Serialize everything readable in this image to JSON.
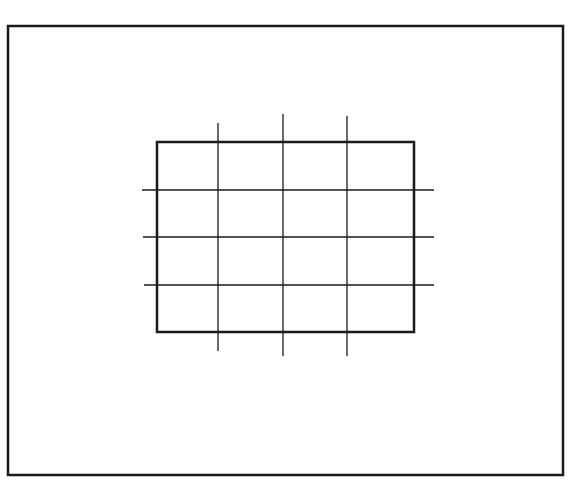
{
  "figure": {
    "stroke_color": "#1a1a1a",
    "background": "#ffffff",
    "outer_frame": {
      "x": 8,
      "y": 26,
      "w": 555,
      "h": 449,
      "stroke_width": 2.5
    },
    "inner_rect": {
      "x": 157,
      "y": 142,
      "w": 257,
      "h": 190,
      "stroke_width": 2.5
    },
    "vertical_lines": [
      {
        "x": 218,
        "y1": 123,
        "y2": 351
      },
      {
        "x": 283,
        "y1": 114,
        "y2": 356
      },
      {
        "x": 347,
        "y1": 116,
        "y2": 356
      }
    ],
    "horizontal_lines": [
      {
        "y": 190,
        "x1": 142,
        "x2": 434
      },
      {
        "y": 237,
        "x1": 143,
        "x2": 434
      },
      {
        "y": 285,
        "x1": 144,
        "x2": 434
      }
    ],
    "grid_line_width": 1.3
  }
}
